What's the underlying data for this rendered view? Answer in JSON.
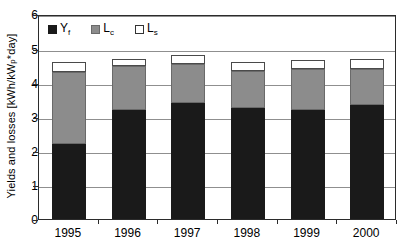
{
  "chart_data": {
    "type": "bar",
    "subtype": "stacked-bar",
    "title": "",
    "xlabel": "",
    "ylabel": "Yields and losses [kWh/kWp*day]",
    "ylabel_main": "Yields and losses [kWh/kW",
    "ylabel_sub": "p",
    "ylabel_tail": "*day]",
    "categories": [
      "1995",
      "1996",
      "1997",
      "1998",
      "1999",
      "2000"
    ],
    "ylim": [
      0,
      6
    ],
    "yticks": [
      0,
      1,
      2,
      3,
      4,
      5,
      6
    ],
    "ytick_labels": [
      "0",
      "1",
      "2",
      "3",
      "4",
      "5",
      "6"
    ],
    "grid": "horizontal",
    "legend_position": "top-left-inside",
    "series": [
      {
        "name": "Yf",
        "label_main": "Y",
        "label_sub": "f",
        "color": "#1a1a1a",
        "values": [
          2.2,
          3.2,
          3.4,
          3.25,
          3.2,
          3.35
        ]
      },
      {
        "name": "Lc",
        "label_main": "L",
        "label_sub": "c",
        "color": "#8c8c8c",
        "values": [
          2.1,
          1.3,
          1.15,
          1.1,
          1.2,
          1.05
        ]
      },
      {
        "name": "Ls",
        "label_main": "L",
        "label_sub": "s",
        "color": "#ffffff",
        "values": [
          0.3,
          0.2,
          0.25,
          0.25,
          0.25,
          0.3
        ]
      }
    ],
    "totals": [
      4.6,
      4.7,
      4.8,
      4.6,
      4.65,
      4.7
    ]
  }
}
